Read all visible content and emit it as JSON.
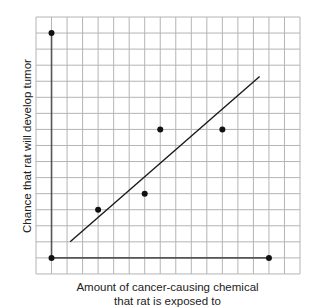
{
  "chart_data": {
    "type": "scatter",
    "title": "",
    "xlabel": "Amount of cancer-causing chemical that rat is exposed to",
    "xlabel_lines": [
      "Amount of cancer-causing chemical",
      "that rat is exposed to"
    ],
    "ylabel": "Chance that rat will develop tumor",
    "grid": true,
    "legend": null,
    "xlim": [
      -1,
      16
    ],
    "ylim": [
      -1,
      15
    ],
    "axis_extent": {
      "x_max": 14,
      "y_max": 14
    },
    "tick_labels": {
      "x": [],
      "y": []
    },
    "series": [
      {
        "name": "observations",
        "kind": "scatter",
        "points": [
          {
            "x": 3,
            "y": 3
          },
          {
            "x": 6,
            "y": 4
          },
          {
            "x": 7,
            "y": 8
          },
          {
            "x": 11,
            "y": 8
          }
        ]
      },
      {
        "name": "trend line",
        "kind": "line",
        "points": [
          {
            "x": 1.2,
            "y": 1.0
          },
          {
            "x": 13.4,
            "y": 11.3
          }
        ]
      }
    ],
    "axis_endpoint_markers": [
      {
        "x": 0,
        "y": 0
      },
      {
        "x": 0,
        "y": 14
      },
      {
        "x": 14,
        "y": 0
      }
    ]
  },
  "layout": {
    "grid_left": 36,
    "grid_top": 17,
    "cols": 17,
    "rows": 16,
    "cell_w": 15.53,
    "cell_h": 16.06,
    "origin_col": 1,
    "origin_row": 15
  },
  "colors": {
    "grid": "#b4b4b4",
    "axis": "#555555",
    "point": "#111111",
    "line": "#1a1a1a"
  }
}
